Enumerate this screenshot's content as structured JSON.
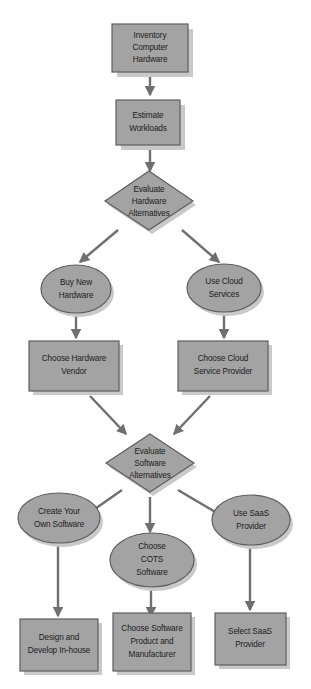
{
  "diagram": {
    "background_color": "#ffffff",
    "node_fill_color": "#a3a3a3",
    "node_border_color": "#5e5e5e",
    "shadow_color": "#c9c9c9",
    "connector_color": "#6f6f6f",
    "text_color": "#1c1c1c"
  },
  "nodes": {
    "inventory": {
      "shape": "rectangle",
      "lines": [
        "Inventory",
        "Computer",
        "Hardware"
      ]
    },
    "estimate": {
      "shape": "rectangle",
      "lines": [
        "Estimate",
        "Workloads"
      ]
    },
    "evaluate_hardware": {
      "shape": "diamond",
      "lines": [
        "Evaluate",
        "Hardware",
        "Alternatives"
      ]
    },
    "buy_new_hardware": {
      "shape": "ellipse",
      "lines": [
        "Buy New",
        "Hardware"
      ]
    },
    "use_cloud_services": {
      "shape": "ellipse",
      "lines": [
        "Use Cloud",
        "Services"
      ]
    },
    "choose_hardware_vendor": {
      "shape": "rectangle",
      "lines": [
        "Choose Hardware",
        "Vendor"
      ]
    },
    "choose_cloud_provider": {
      "shape": "rectangle",
      "lines": [
        "Choose Cloud",
        "Service Provider"
      ]
    },
    "evaluate_software": {
      "shape": "diamond",
      "lines": [
        "Evaluate",
        "Software",
        "Alternatives"
      ]
    },
    "create_own_software": {
      "shape": "ellipse",
      "lines": [
        "Create Your",
        "Own Software"
      ]
    },
    "choose_cots_software": {
      "shape": "ellipse",
      "lines": [
        "Choose",
        "COTS",
        "Software"
      ]
    },
    "use_saas_provider": {
      "shape": "ellipse",
      "lines": [
        "Use SaaS",
        "Provider"
      ]
    },
    "design_develop_inhouse": {
      "shape": "rectangle",
      "lines": [
        "Design and",
        "Develop In-house"
      ]
    },
    "choose_software_product": {
      "shape": "rectangle",
      "lines": [
        "Choose Software",
        "Product and",
        "Manufacturer"
      ]
    },
    "select_saas_provider": {
      "shape": "rectangle",
      "lines": [
        "Select SaaS",
        "Provider"
      ]
    }
  },
  "edges": [
    {
      "from": "inventory",
      "to": "estimate"
    },
    {
      "from": "estimate",
      "to": "evaluate_hardware"
    },
    {
      "from": "evaluate_hardware",
      "to": "buy_new_hardware"
    },
    {
      "from": "evaluate_hardware",
      "to": "use_cloud_services"
    },
    {
      "from": "buy_new_hardware",
      "to": "choose_hardware_vendor"
    },
    {
      "from": "use_cloud_services",
      "to": "choose_cloud_provider"
    },
    {
      "from": "choose_hardware_vendor",
      "to": "evaluate_software"
    },
    {
      "from": "choose_cloud_provider",
      "to": "evaluate_software"
    },
    {
      "from": "evaluate_software",
      "to": "create_own_software"
    },
    {
      "from": "evaluate_software",
      "to": "choose_cots_software"
    },
    {
      "from": "evaluate_software",
      "to": "use_saas_provider"
    },
    {
      "from": "create_own_software",
      "to": "design_develop_inhouse"
    },
    {
      "from": "choose_cots_software",
      "to": "choose_software_product"
    },
    {
      "from": "use_saas_provider",
      "to": "select_saas_provider"
    }
  ]
}
